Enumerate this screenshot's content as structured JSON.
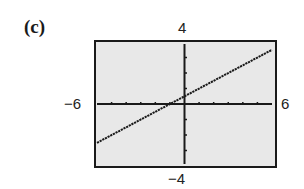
{
  "panel": {
    "label": "(c)"
  },
  "window": {
    "xmin_label": "−6",
    "xmax_label": "6",
    "ymin_label": "−4",
    "ymax_label": "4"
  },
  "colors": {
    "background": "#e8e8e8",
    "frame": "#1a1a1a",
    "axis": "#1a1a1a",
    "line": "#1a1a1a"
  },
  "chart_data": {
    "type": "line",
    "title": "(c)",
    "xlabel": "",
    "ylabel": "",
    "xlim": [
      -6,
      6
    ],
    "ylim": [
      -4,
      4
    ],
    "xscl": 1,
    "yscl": 1,
    "grid": false,
    "series": [
      {
        "name": "y = (x + 1)/2",
        "x": [
          -6,
          -4,
          -2,
          -1,
          0,
          2,
          4,
          6
        ],
        "y": [
          -2.5,
          -1.5,
          -0.5,
          0,
          0.5,
          1.5,
          2.5,
          3.5
        ]
      }
    ],
    "tick_labels": {
      "left": "−6",
      "right": "6",
      "top": "4",
      "bottom": "−4"
    }
  }
}
